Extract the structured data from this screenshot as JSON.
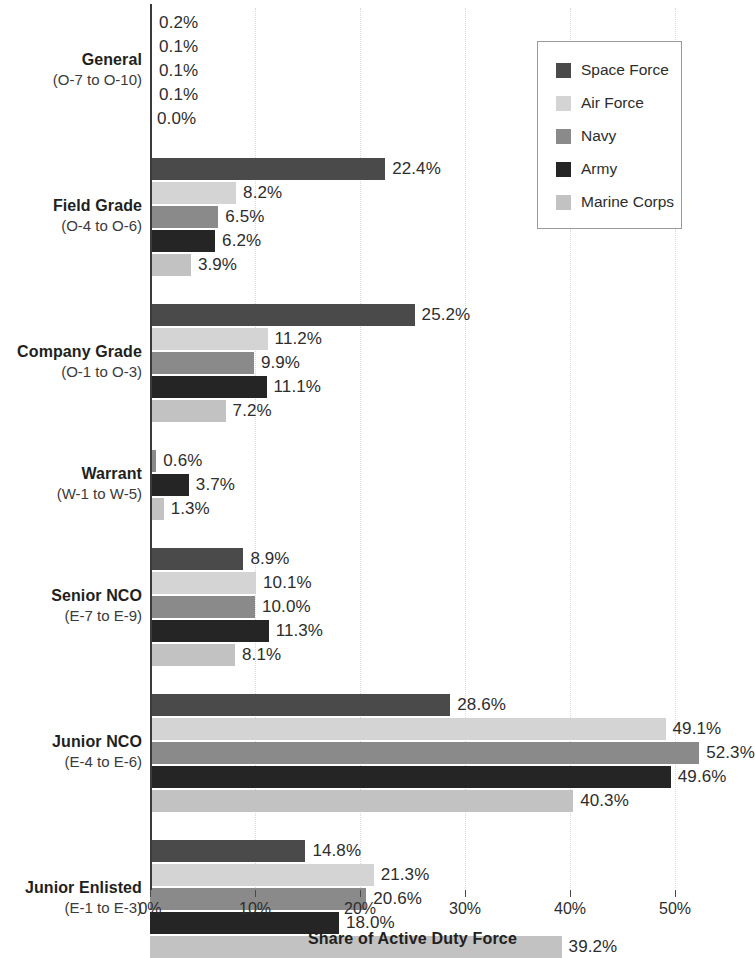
{
  "chart_data": {
    "type": "bar",
    "orientation": "horizontal",
    "title": "",
    "xlabel": "Share of Active Duty Force",
    "ylabel": "",
    "xlim": [
      0,
      50
    ],
    "xticks": [
      0,
      10,
      20,
      30,
      40,
      50
    ],
    "xtick_labels": [
      "0%",
      "10%",
      "20%",
      "30%",
      "40%",
      "50%"
    ],
    "grid": true,
    "grid_axis": "x",
    "legend_position": "top-right",
    "value_label_suffix": "%",
    "categories": [
      "General",
      "Field Grade",
      "Company Grade",
      "Warrant",
      "Senior NCO",
      "Junior NCO",
      "Junior Enlisted"
    ],
    "category_sublabels": [
      "(O-7 to O-10)",
      "(O-4 to O-6)",
      "(O-1 to O-3)",
      "(W-1 to W-5)",
      "(E-7 to E-9)",
      "(E-4 to E-6)",
      "(E-1 to E-3)"
    ],
    "series": [
      {
        "name": "Space Force",
        "color": "#4a4a4a",
        "values": [
          0.2,
          22.4,
          25.2,
          null,
          8.9,
          28.6,
          14.8
        ],
        "labels": [
          "0.2%",
          "22.4%",
          "25.2%",
          null,
          "8.9%",
          "28.6%",
          "14.8%"
        ]
      },
      {
        "name": "Air Force",
        "color": "#d4d4d4",
        "values": [
          0.1,
          8.2,
          11.2,
          null,
          10.1,
          49.1,
          21.3
        ],
        "labels": [
          "0.1%",
          "8.2%",
          "11.2%",
          null,
          "10.1%",
          "49.1%",
          "21.3%"
        ]
      },
      {
        "name": "Navy",
        "color": "#8a8a8a",
        "values": [
          0.1,
          6.5,
          9.9,
          0.6,
          10.0,
          52.3,
          20.6
        ],
        "labels": [
          "0.1%",
          "6.5%",
          "9.9%",
          "0.6%",
          "10.0%",
          "52.3%",
          "20.6%"
        ]
      },
      {
        "name": "Army",
        "color": "#252525",
        "values": [
          0.1,
          6.2,
          11.1,
          3.7,
          11.3,
          49.6,
          18.0
        ],
        "labels": [
          "0.1%",
          "6.2%",
          "11.1%",
          "3.7%",
          "11.3%",
          "49.6%",
          "18.0%"
        ]
      },
      {
        "name": "Marine Corps",
        "color": "#c2c2c2",
        "values": [
          0.0,
          3.9,
          7.2,
          1.3,
          8.1,
          40.3,
          39.2
        ],
        "labels": [
          "0.0%",
          "3.9%",
          "7.2%",
          "1.3%",
          "8.1%",
          "40.3%",
          "39.2%"
        ]
      }
    ]
  },
  "legend": {
    "items": [
      {
        "label": "Space Force",
        "color": "#4a4a4a"
      },
      {
        "label": "Air Force",
        "color": "#d4d4d4"
      },
      {
        "label": "Navy",
        "color": "#8a8a8a"
      },
      {
        "label": "Army",
        "color": "#252525"
      },
      {
        "label": "Marine Corps",
        "color": "#c2c2c2"
      }
    ]
  },
  "axis": {
    "x_title": "Share of Active Duty Force"
  }
}
